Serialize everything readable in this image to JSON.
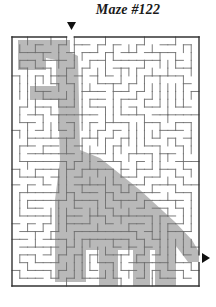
{
  "puzzle": {
    "title": "Maze #122",
    "entry_arrow": "down-arrow",
    "exit_arrow": "right-arrow"
  },
  "layout": {
    "frame": {
      "x": 12,
      "y": 37,
      "w": 187,
      "h": 249
    },
    "cols": 24,
    "rows": 32,
    "entry_col": 7,
    "exit_row": 28
  },
  "colors": {
    "background": "#ffffff",
    "wall": "#6e6e6e",
    "frame": "#333333",
    "silhouette": "#b9b9b9",
    "arrow": "#111111",
    "title": "#1a1a1a"
  },
  "silhouette": {
    "shape": "long-necked-dinosaur",
    "points": "18,40 70,40 70,52 78,56 80,150 100,158 140,190 175,222 192,240 199,252 199,262 188,262 176,246 176,286 155,286 155,250 150,250 150,286 133,286 133,250 118,250 118,286 99,286 99,250 86,250 86,282 55,282 55,200 60,160 58,100 30,100 30,86 56,86 56,60 46,58 46,70 18,70"
  }
}
